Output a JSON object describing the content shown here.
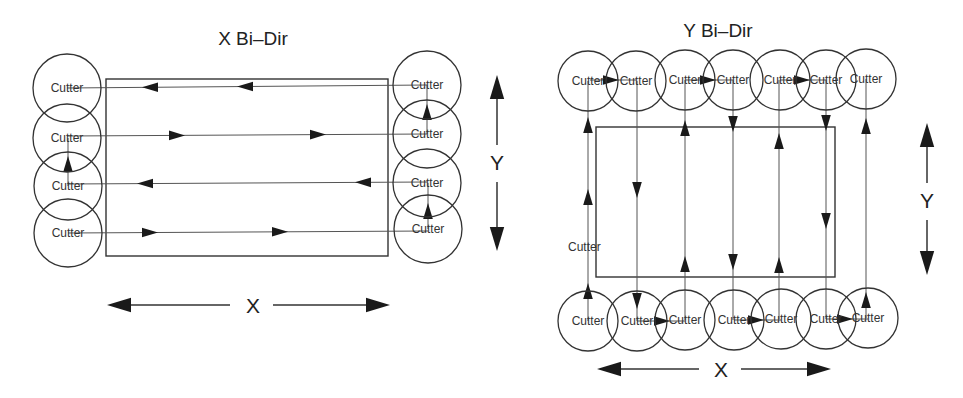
{
  "diagrams": [
    {
      "id": "x-bidir",
      "title": "X Bi–Dir",
      "title_pos": [
        253,
        45
      ],
      "cutter_label": "Cutter",
      "stock_rect": {
        "x": 106,
        "y": 79,
        "w": 282,
        "h": 177
      },
      "cutters_left": [
        {
          "cx": 67,
          "cy": 88
        },
        {
          "cx": 67,
          "cy": 138
        },
        {
          "cx": 68,
          "cy": 186
        },
        {
          "cx": 68,
          "cy": 233
        }
      ],
      "cutters_right": [
        {
          "cx": 427,
          "cy": 85
        },
        {
          "cx": 427,
          "cy": 134
        },
        {
          "cx": 427,
          "cy": 183
        },
        {
          "cx": 428,
          "cy": 229
        }
      ],
      "cutter_radius": 34,
      "passes": [
        {
          "y1": 88,
          "y2": 85,
          "direction": "left",
          "arrows_x": [
            150,
            245
          ]
        },
        {
          "y1": 136,
          "y2": 134,
          "direction": "right",
          "arrows_x": [
            177,
            318
          ]
        },
        {
          "y1": 184,
          "y2": 182,
          "direction": "left",
          "arrows_x": [
            145,
            363
          ]
        },
        {
          "y1": 233,
          "y2": 231,
          "direction": "right",
          "arrows_x": [
            150,
            280
          ]
        }
      ],
      "stepovers": [
        {
          "x": 427,
          "y_from": 134,
          "y_to": 85,
          "arrow_y": 112
        },
        {
          "x": 68,
          "y_from": 186,
          "y_to": 138,
          "arrow_y": 164
        },
        {
          "x": 428,
          "y_from": 229,
          "y_to": 183,
          "arrow_y": 211
        }
      ],
      "axis_x": {
        "label": "X",
        "y": 305,
        "x1": 107,
        "x2": 230,
        "x3": 273,
        "x4": 390,
        "label_x": 253
      },
      "axis_y": {
        "label": "Y",
        "x": 497,
        "y1": 75,
        "y2": 145,
        "y3": 182,
        "y4": 251,
        "label_y": 170
      }
    },
    {
      "id": "y-bidir",
      "title": "Y Bi–Dir",
      "title_pos": [
        718,
        37
      ],
      "cutter_label": "Cutter",
      "stock_rect": {
        "x": 596,
        "y": 127,
        "w": 239,
        "h": 150
      },
      "cutters_top": [
        {
          "cx": 588,
          "cy": 81
        },
        {
          "cx": 636,
          "cy": 81
        },
        {
          "cx": 685,
          "cy": 80
        },
        {
          "cx": 733,
          "cy": 80
        },
        {
          "cx": 780,
          "cy": 80
        },
        {
          "cx": 826,
          "cy": 80
        },
        {
          "cx": 866,
          "cy": 79
        }
      ],
      "cutters_bottom": [
        {
          "cx": 588,
          "cy": 321
        },
        {
          "cx": 637,
          "cy": 321
        },
        {
          "cx": 685,
          "cy": 320
        },
        {
          "cx": 734,
          "cy": 320
        },
        {
          "cx": 781,
          "cy": 319
        },
        {
          "cx": 826,
          "cy": 319
        },
        {
          "cx": 868,
          "cy": 318
        }
      ],
      "cutter_radius": 30,
      "passes": [
        {
          "x": 588,
          "direction": "up",
          "arrows_y": [
            125,
            197,
            291
          ]
        },
        {
          "x": 637,
          "direction": "down",
          "arrows_y": [
            190,
            301
          ]
        },
        {
          "x": 685,
          "direction": "up",
          "arrows_y": [
            128,
            264
          ]
        },
        {
          "x": 733,
          "direction": "down",
          "arrows_y": [
            124,
            262
          ]
        },
        {
          "x": 779,
          "direction": "up",
          "arrows_y": [
            141,
            265
          ]
        },
        {
          "x": 826,
          "direction": "down",
          "arrows_y": [
            123,
            221
          ]
        },
        {
          "x": 866,
          "direction": "up",
          "arrows_y": [
            126,
            300
          ]
        }
      ],
      "stepovers_top": [
        {
          "y": 80,
          "x_from": 590,
          "x_to": 636,
          "arrow_x": 611
        },
        {
          "y": 80,
          "x_from": 686,
          "x_to": 733,
          "arrow_x": 708
        },
        {
          "y": 80,
          "x_from": 780,
          "x_to": 826,
          "arrow_x": 802
        }
      ],
      "stepovers_bottom": [
        {
          "y": 321,
          "x_from": 637,
          "x_to": 685,
          "arrow_x": 662
        },
        {
          "y": 320,
          "x_from": 734,
          "x_to": 781,
          "arrow_x": 756
        },
        {
          "y": 319,
          "x_from": 826,
          "x_to": 868,
          "arrow_x": 845
        }
      ],
      "stray_label": {
        "text": "Cutter",
        "x": 568,
        "y": 251
      },
      "axis_x": {
        "label": "X",
        "y": 369,
        "x1": 597,
        "x2": 699,
        "x3": 741,
        "x4": 831,
        "label_x": 721
      },
      "axis_y": {
        "label": "Y",
        "x": 927,
        "y1": 123,
        "y2": 183,
        "y3": 220,
        "y4": 275,
        "label_y": 208
      }
    }
  ]
}
